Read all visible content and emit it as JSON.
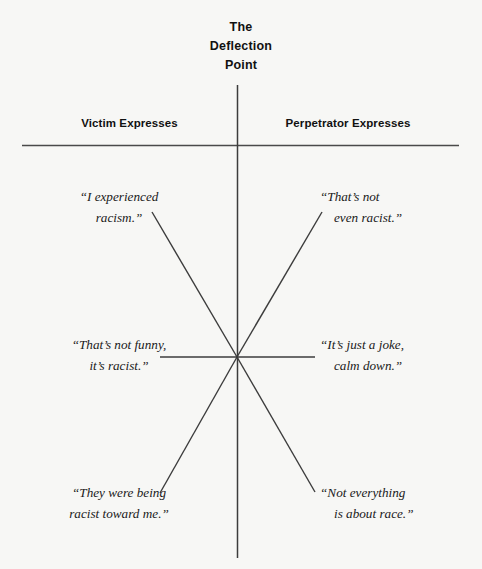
{
  "title": {
    "line1": "The",
    "line2": "Deflection",
    "line3": "Point"
  },
  "headers": {
    "left": "Victim Expresses",
    "right": "Perpetrator Expresses"
  },
  "quotes": {
    "top_left": {
      "line1": "“I experienced",
      "line2": "racism.”"
    },
    "top_right": {
      "line1": "“That’s not",
      "line2": "even racist.”"
    },
    "middle_left": {
      "line1": "“That’s not funny,",
      "line2": "it’s racist.”"
    },
    "middle_right": {
      "line1": "“It’s just a joke,",
      "line2": "calm down.”"
    },
    "bottom_left": {
      "line1": "“They were being",
      "line2": "racist toward me.”"
    },
    "bottom_right": {
      "line1": "“Not everything",
      "line2": "is about race.”"
    }
  },
  "colors": {
    "background": "#f7f7f5",
    "line": "#3c3c3c",
    "rule": "#4a4a4a",
    "text": "#111111"
  },
  "geometry": {
    "center_x": 237,
    "center_y": 357,
    "axis_top_y": 85,
    "axis_bottom_y": 558,
    "rule_y": 145,
    "rule_left_x": 22,
    "rule_right_x": 459
  }
}
